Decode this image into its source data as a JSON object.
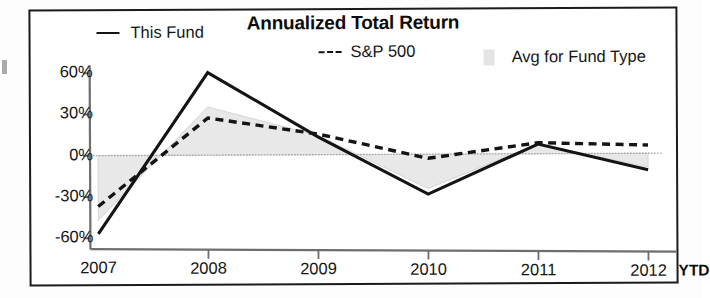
{
  "chart_data": {
    "type": "line",
    "title": "Annualized Total Return",
    "xlabel": "",
    "ylabel": "",
    "categories": [
      "2007",
      "2008",
      "2009",
      "2010",
      "2011",
      "2012"
    ],
    "x_axis_suffix_label": "YTD",
    "ylim": [
      -60,
      60
    ],
    "ytick_labels": [
      "60%",
      "30%",
      "0%",
      "-30%",
      "-60%"
    ],
    "ytick_values": [
      60,
      30,
      0,
      -30,
      -60
    ],
    "grid": false,
    "legend_position": "top",
    "zero_line": true,
    "series": [
      {
        "name": "This Fund",
        "style": "solid",
        "color": "#141414",
        "values": [
          -57,
          60,
          13,
          -29,
          7,
          -12
        ]
      },
      {
        "name": "S&P 500",
        "style": "dashed",
        "color": "#141414",
        "values": [
          -37,
          27,
          15,
          -3,
          8,
          6
        ]
      },
      {
        "name": "Avg for Fund Type",
        "style": "band",
        "color": "#d6d6d6",
        "values": [
          -47,
          35,
          14,
          -25,
          7,
          -10
        ]
      }
    ]
  },
  "legend": {
    "this_fund": "This Fund",
    "sp500": "S&P 500",
    "avg_fund_type": "Avg for Fund Type"
  },
  "colors": {
    "line": "#141414",
    "band": "#d6d6d6",
    "axis": "#6e6e6e",
    "border": "#1b1b1b"
  }
}
